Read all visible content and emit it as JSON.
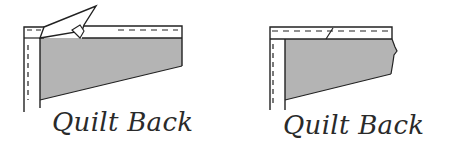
{
  "figures": [
    {
      "id": "left",
      "caption": "Quilt Back",
      "state": "binding-corner-folded"
    },
    {
      "id": "right",
      "caption": "Quilt Back",
      "state": "binding-corner-mitered"
    }
  ],
  "colors": {
    "fabric_fill": "#b4b4b4",
    "outline": "#222222",
    "background": "#ffffff"
  }
}
